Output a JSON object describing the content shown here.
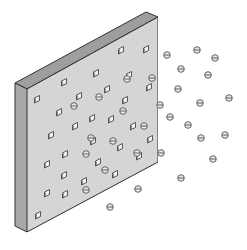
{
  "diagram": {
    "title": "",
    "colors": {
      "background": "#ffffff",
      "front_face": "#d9d9d9",
      "side_face": "#a9a9a9",
      "top_face": "#9e9e9e",
      "outline": "#333333",
      "pore_fill": "#f2f2f2",
      "particle_fill": "#e6e6e6",
      "particle_stroke": "#555555"
    },
    "wall": {
      "front": [
        [
          27,
          89
        ],
        [
          158,
          17
        ],
        [
          158,
          162
        ],
        [
          27,
          232
        ]
      ],
      "side": [
        [
          15,
          83
        ],
        [
          27,
          89
        ],
        [
          27,
          232
        ],
        [
          15,
          226
        ]
      ],
      "top": [
        [
          15,
          83
        ],
        [
          146,
          12
        ],
        [
          158,
          17
        ],
        [
          27,
          89
        ]
      ]
    },
    "pores": [
      [
        121,
        50
      ],
      [
        146,
        49
      ],
      [
        96,
        73
      ],
      [
        129,
        75
      ],
      [
        64,
        82
      ],
      [
        107,
        89
      ],
      [
        149,
        87
      ],
      [
        37,
        99
      ],
      [
        79,
        96
      ],
      [
        125,
        100
      ],
      [
        59,
        112
      ],
      [
        92,
        118
      ],
      [
        111,
        119
      ],
      [
        51,
        135
      ],
      [
        75,
        126
      ],
      [
        133,
        126
      ],
      [
        93,
        141
      ],
      [
        150,
        139
      ],
      [
        65,
        154
      ],
      [
        98,
        162
      ],
      [
        120,
        147
      ],
      [
        47,
        164
      ],
      [
        139,
        156
      ],
      [
        64,
        175
      ],
      [
        115,
        174
      ],
      [
        84,
        181
      ],
      [
        47,
        193
      ],
      [
        65,
        194
      ],
      [
        38,
        215
      ]
    ],
    "particles": [
      [
        167,
        55
      ],
      [
        197,
        50
      ],
      [
        215,
        58
      ],
      [
        181,
        69
      ],
      [
        208,
        75
      ],
      [
        152,
        78
      ],
      [
        127,
        79
      ],
      [
        99,
        97
      ],
      [
        74,
        106
      ],
      [
        178,
        89
      ],
      [
        229,
        98
      ],
      [
        200,
        103
      ],
      [
        160,
        105
      ],
      [
        123,
        111
      ],
      [
        170,
        117
      ],
      [
        144,
        126
      ],
      [
        188,
        125
      ],
      [
        91,
        138
      ],
      [
        113,
        141
      ],
      [
        201,
        138
      ],
      [
        225,
        135
      ],
      [
        161,
        153
      ],
      [
        86,
        154
      ],
      [
        137,
        153
      ],
      [
        213,
        159
      ],
      [
        105,
        170
      ],
      [
        181,
        178
      ],
      [
        86,
        190
      ],
      [
        138,
        189
      ],
      [
        110,
        207
      ]
    ]
  }
}
